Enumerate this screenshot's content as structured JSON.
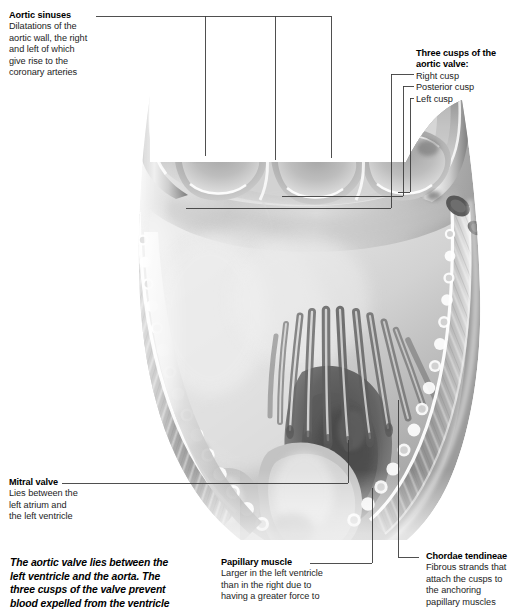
{
  "figure": {
    "style": "grayscale-anatomical-illustration"
  },
  "labels": {
    "aortic_sinuses": {
      "title": "Aortic sinuses",
      "lines": [
        "Dilatations of the",
        "aortic wall, the right",
        "and left of which",
        "give rise to the",
        "coronary arteries"
      ]
    },
    "three_cusps": {
      "title_line1": "Three cusps of the",
      "title_line2": "aortic valve:",
      "items": [
        "Right cusp",
        "Posterior cusp",
        "Left cusp"
      ]
    },
    "mitral_valve": {
      "title": "Mitral valve",
      "lines": [
        "Lies between the",
        "left atrium and",
        "the left ventricle"
      ]
    },
    "papillary_muscle": {
      "title": "Papillary muscle",
      "lines": [
        "Larger in the left ventricle",
        "than in the right due to",
        "having a greater force to"
      ]
    },
    "chordae_tendineae": {
      "title": "Chordae tendineae",
      "lines": [
        "Fibrous strands that",
        "attach the cusps to",
        "the anchoring",
        "papillary muscles"
      ]
    }
  },
  "caption": {
    "lines": [
      "The aortic valve lies between the",
      "left ventricle and the aorta. The",
      "three cusps of the valve prevent",
      "blood expelled from the ventricle"
    ]
  },
  "colors": {
    "background": "#ffffff",
    "ink": "#1a1a1a",
    "leader_line": "#3c3c3c",
    "tissue_light": "#f2f2f2",
    "tissue_mid": "#b8b8b8",
    "tissue_dark": "#6e6e6e",
    "tissue_shadow": "#4a4a4a",
    "cavity_dark": "#5c5c5c"
  }
}
